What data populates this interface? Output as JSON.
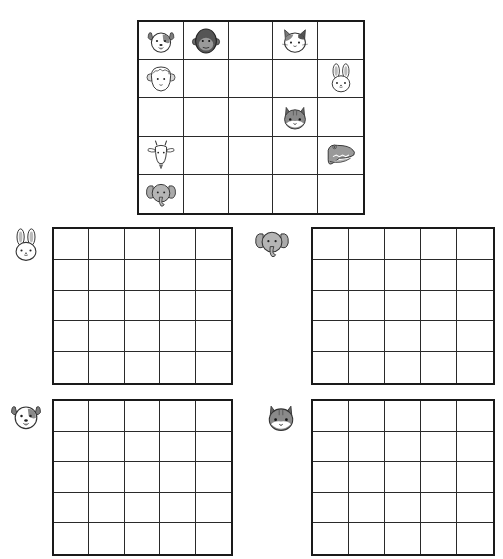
{
  "puzzle": {
    "title": "Animal grid puzzle",
    "rows": 5,
    "cols": 5,
    "clue_grid": [
      [
        "dog",
        "gorilla",
        "",
        "cat",
        ""
      ],
      [
        "sheep",
        "",
        "",
        "",
        "bunny"
      ],
      [
        "",
        "",
        "",
        "squirrel",
        ""
      ],
      [
        "goat",
        "",
        "",
        "",
        "crocodile"
      ],
      [
        "elephant",
        "",
        "",
        "",
        ""
      ]
    ],
    "answer_grids": [
      {
        "animal": "bunny",
        "icon": "bunny-icon",
        "cells": [
          [
            "",
            "",
            "",
            "",
            ""
          ],
          [
            "",
            "",
            "",
            "",
            ""
          ],
          [
            "",
            "",
            "",
            "",
            ""
          ],
          [
            "",
            "",
            "",
            "",
            ""
          ],
          [
            "",
            "",
            "",
            "",
            ""
          ]
        ]
      },
      {
        "animal": "elephant",
        "icon": "elephant-icon",
        "cells": [
          [
            "",
            "",
            "",
            "",
            ""
          ],
          [
            "",
            "",
            "",
            "",
            ""
          ],
          [
            "",
            "",
            "",
            "",
            ""
          ],
          [
            "",
            "",
            "",
            "",
            ""
          ],
          [
            "",
            "",
            "",
            "",
            ""
          ]
        ]
      },
      {
        "animal": "dog",
        "icon": "dog-icon",
        "cells": [
          [
            "",
            "",
            "",
            "",
            ""
          ],
          [
            "",
            "",
            "",
            "",
            ""
          ],
          [
            "",
            "",
            "",
            "",
            ""
          ],
          [
            "",
            "",
            "",
            "",
            ""
          ],
          [
            "",
            "",
            "",
            "",
            ""
          ]
        ]
      },
      {
        "animal": "squirrel",
        "icon": "squirrel-icon",
        "cells": [
          [
            "",
            "",
            "",
            "",
            ""
          ],
          [
            "",
            "",
            "",
            "",
            ""
          ],
          [
            "",
            "",
            "",
            "",
            ""
          ],
          [
            "",
            "",
            "",
            "",
            ""
          ],
          [
            "",
            "",
            "",
            "",
            ""
          ]
        ]
      }
    ]
  },
  "colors": {
    "grid_line": "#1a1a1a",
    "background": "#ffffff",
    "icon_gray": "#9a9a9a",
    "icon_dark": "#5a5a5a"
  }
}
